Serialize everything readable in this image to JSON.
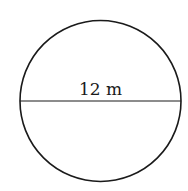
{
  "diagram": {
    "shape": "circle",
    "diameter_label": "12 m",
    "stroke_color": "#1a1a1a",
    "background_color": "#ffffff"
  }
}
